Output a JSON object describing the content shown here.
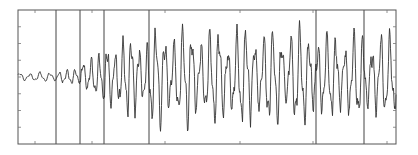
{
  "chart_data": {
    "type": "line",
    "title": "",
    "xlabel": "",
    "ylabel": "",
    "grid": false,
    "legend": null,
    "frame": {
      "left": 18,
      "top": 10,
      "right": 396,
      "bottom": 144
    },
    "y_ticks_count": 9,
    "x_tick_positions_px": [
      35,
      92,
      165,
      240,
      313,
      387
    ],
    "vertical_markers_px": [
      56,
      80,
      104,
      149,
      316,
      364
    ],
    "baseline_y_px": 77,
    "series": [
      {
        "name": "signal",
        "description": "Oscillating waveform: low-amplitude noise at left (x 18-56), small oscillations (56-104), then large-amplitude quasi-periodic oscillations with roughly 8px period and peaks spanning ~y 30 to ~y 125 from x 104 to 396.",
        "segments": [
          {
            "x_start": 18,
            "x_end": 56,
            "amplitude_px": 4,
            "period_px": 10
          },
          {
            "x_start": 56,
            "x_end": 80,
            "amplitude_px": 6,
            "period_px": 8
          },
          {
            "x_start": 80,
            "x_end": 104,
            "amplitude_px": 18,
            "period_px": 8
          },
          {
            "x_start": 104,
            "x_end": 150,
            "amplitude_px": 32,
            "period_px": 8
          },
          {
            "x_start": 150,
            "x_end": 316,
            "amplitude_px": 40,
            "period_px": 9
          },
          {
            "x_start": 316,
            "x_end": 396,
            "amplitude_px": 36,
            "period_px": 9
          }
        ]
      }
    ],
    "colors": {
      "line": "#333333",
      "frame": "#555555",
      "marker": "#444444",
      "background": "#ffffff"
    }
  }
}
